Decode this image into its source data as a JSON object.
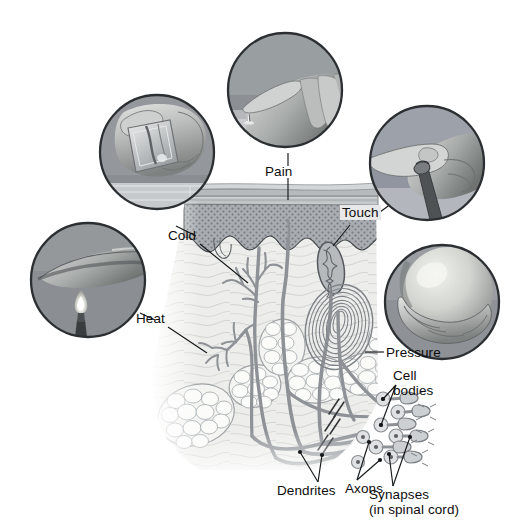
{
  "figure": {
    "background": "#ffffff",
    "width": 519,
    "height": 531
  },
  "labels": {
    "pain": "Pain",
    "cold": "Cold",
    "touch": "Touch",
    "heat": "Heat",
    "pressure": "Pressure",
    "cell_bodies_line1": "Cell",
    "cell_bodies_line2": "bodies",
    "dendrites": "Dendrites",
    "axons": "Axons",
    "synapses_line1": "Synapses",
    "synapses_line2": "(in spinal cord)"
  },
  "photos": [
    {
      "id": "pain-photo",
      "stimulus": "Pain",
      "description": "Fingertip pressing on an upright tack or pin",
      "cx": 285,
      "cy": 90,
      "r": 57
    },
    {
      "id": "cold-photo",
      "stimulus": "Cold",
      "description": "Hand holding an ice cube above a glass",
      "cx": 157,
      "cy": 152,
      "r": 57
    },
    {
      "id": "touch-photo",
      "stimulus": "Touch",
      "description": "Fingertip touching the tip of a brush",
      "cx": 427,
      "cy": 163,
      "r": 57
    },
    {
      "id": "heat-photo",
      "stimulus": "Heat",
      "description": "Finger held above a lit candle flame",
      "cx": 88,
      "cy": 280,
      "r": 57
    },
    {
      "id": "pressure-photo",
      "stimulus": "Pressure",
      "description": "Hand cradling a smooth round ball",
      "cx": 442,
      "cy": 302,
      "r": 57
    }
  ],
  "anatomy": {
    "layers": [
      {
        "name": "stratum-corneum",
        "label": "Surface keratin layer"
      },
      {
        "name": "epidermis",
        "label": "Epidermis"
      },
      {
        "name": "dermis",
        "label": "Dermis"
      },
      {
        "name": "hypodermis",
        "label": "Subcutaneous fat"
      }
    ],
    "receptors": [
      {
        "name": "free-nerve-ending-cold",
        "stimulus": "Cold"
      },
      {
        "name": "free-nerve-ending-heat",
        "stimulus": "Heat"
      },
      {
        "name": "free-nerve-ending-pain",
        "stimulus": "Pain"
      },
      {
        "name": "meissner-corpuscle",
        "stimulus": "Touch"
      },
      {
        "name": "pacinian-corpuscle",
        "stimulus": "Pressure"
      }
    ],
    "neuron_parts": [
      "Dendrites",
      "Axons",
      "Cell bodies",
      "Synapses"
    ]
  },
  "colors": {
    "text": "#0d0d0d",
    "leader_line": "#1a1a1a",
    "nerve": "#8e9296",
    "nerve_dark": "#6f7479",
    "epidermis_fill": "#a9adb1",
    "epidermis_stipple": "#6f7478",
    "keratin_band": "#c3c7ca",
    "keratin_band_dark": "#9a9ea2",
    "dermis_fill": "#ececea",
    "dermis_lines": "#c9cbc8",
    "fat_fill": "#f2f2f0",
    "fat_outline": "#9fa3a6",
    "photo_dark": "#5a5d61",
    "photo_mid": "#8b8f93",
    "photo_light": "#c8ccd0",
    "photo_ring": "#2a2d30",
    "touch_caption_bg": "#e8e8e8"
  }
}
